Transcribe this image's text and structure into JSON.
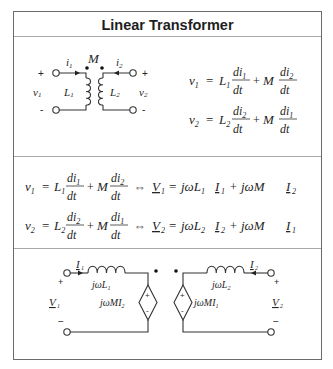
{
  "title": "Linear Transformer",
  "section1": {
    "circuit": {
      "mutual_label": "M",
      "left": {
        "current": "i",
        "current_sub": "1",
        "voltage": "v",
        "voltage_sub": "1",
        "inductor": "L",
        "inductor_sub": "1",
        "plus": "+",
        "minus": "-"
      },
      "right": {
        "current": "i",
        "current_sub": "2",
        "voltage": "v",
        "voltage_sub": "2",
        "inductor": "L",
        "inductor_sub": "2",
        "plus": "+",
        "minus": "-"
      }
    },
    "equations": [
      {
        "lhs": "v",
        "lhs_sub": "1",
        "L": "L",
        "L_sub": "1",
        "self_num": "di",
        "self_num_sub": "1",
        "den": "dt",
        "plus": "+",
        "M": "M",
        "mut_num": "di",
        "mut_num_sub": "2",
        "eq": "="
      },
      {
        "lhs": "v",
        "lhs_sub": "2",
        "L": "L",
        "L_sub": "2",
        "self_num": "di",
        "self_num_sub": "2",
        "den": "dt",
        "plus": "+",
        "M": "M",
        "mut_num": "di",
        "mut_num_sub": "1",
        "eq": "="
      }
    ]
  },
  "section2": {
    "rows": [
      {
        "time_domain": {
          "lhs": "v",
          "lhs_sub": "1",
          "L": "L",
          "L_sub": "1",
          "self_num": "di",
          "self_num_sub": "1",
          "den": "dt",
          "M": "M",
          "mut_num": "di",
          "mut_num_sub": "2"
        },
        "iff": "⇔",
        "phasor": {
          "V": "V",
          "V_sub": "1",
          "rhs1": "jωL",
          "rhs1_sub": "1",
          "I_a": "I",
          "I_a_sub": "1",
          "rhs2": "jωM",
          "I_b": "I",
          "I_b_sub": "2"
        }
      },
      {
        "time_domain": {
          "lhs": "v",
          "lhs_sub": "2",
          "L": "L",
          "L_sub": "2",
          "self_num": "di",
          "self_num_sub": "2",
          "den": "dt",
          "M": "M",
          "mut_num": "di",
          "mut_num_sub": "1"
        },
        "iff": "⇔",
        "phasor": {
          "V": "V",
          "V_sub": "2",
          "rhs1": "jωL",
          "rhs1_sub": "2",
          "I_a": "I",
          "I_a_sub": "2",
          "rhs2": "jωM",
          "I_b": "I",
          "I_b_sub": "1"
        }
      }
    ]
  },
  "section3": {
    "left": {
      "current": "I",
      "current_sub": "1",
      "inductor": "jωL",
      "inductor_sub": "1",
      "source": "jωMI",
      "source_sub": "2",
      "voltage": "V",
      "voltage_sub": "1",
      "plus": "+",
      "minus": "−"
    },
    "right": {
      "current": "I",
      "current_sub": "2",
      "inductor": "jωL",
      "inductor_sub": "2",
      "source": "jωMI",
      "source_sub": "1",
      "voltage": "V",
      "voltage_sub": "2",
      "plus": "+",
      "minus": "−"
    },
    "source_plus": "+",
    "source_minus": "-"
  }
}
